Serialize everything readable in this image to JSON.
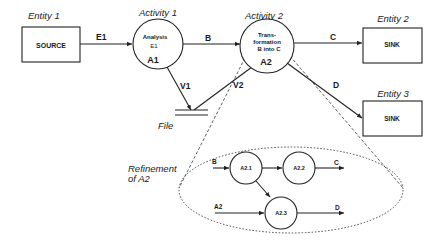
{
  "entities": [
    {
      "id": "entity-1",
      "caption": "Entity 1",
      "label": "SOURCE"
    },
    {
      "id": "entity-2",
      "caption": "Entity 2",
      "label": "SINK"
    },
    {
      "id": "entity-3",
      "caption": "Entity 3",
      "label": "SINK"
    }
  ],
  "activities": [
    {
      "id": "activity-1",
      "caption": "Activity 1",
      "line1": "Analysis",
      "line2": "E1",
      "code": "A1"
    },
    {
      "id": "activity-2",
      "caption": "Activity 2",
      "line1": "Trans-",
      "line2": "formation",
      "line3": "B into C",
      "code": "A2"
    }
  ],
  "file": {
    "caption": "File"
  },
  "flows": {
    "e1": "E1",
    "b": "B",
    "c": "C",
    "d": "D",
    "v1": "V1",
    "v2": "V2"
  },
  "refinement": {
    "caption_line1": "Refinement",
    "caption_line2": "of A2",
    "nodes": [
      "A2.1",
      "A2.2",
      "A2.3"
    ],
    "inputs": {
      "b": "B",
      "a2": "A2"
    },
    "outputs": {
      "c": "C",
      "d": "D"
    }
  }
}
